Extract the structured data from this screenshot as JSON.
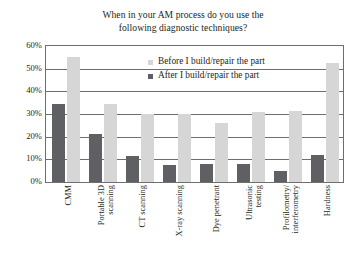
{
  "chart_data": {
    "type": "bar",
    "title": "When in your AM process do you use the following diagnostic techniques?",
    "title_lines": [
      "When in your AM process do you use the",
      "following diagnostic techniques?"
    ],
    "xlabel": "",
    "ylabel": "",
    "ylim": [
      0,
      60
    ],
    "ytick_labels": [
      "0%",
      "10%",
      "20%",
      "30%",
      "40%",
      "50%",
      "60%"
    ],
    "ytick_values": [
      0,
      10,
      20,
      30,
      40,
      50,
      60
    ],
    "grid": true,
    "legend_position": "inside-top-right",
    "categories": [
      "CMM",
      "Portable 3D scanning",
      "CT scanning",
      "X-ray scanning",
      "Dye penetrant",
      "Ultrasonic testing",
      "Profilometry/interferometry",
      "Hardness"
    ],
    "category_lines": [
      [
        "CMM"
      ],
      [
        "Portable 3D",
        "scanning"
      ],
      [
        "CT scanning"
      ],
      [
        "X-ray scanning"
      ],
      [
        "Dye penetrant"
      ],
      [
        "Ultrasonic",
        "testing"
      ],
      [
        "Profilometry/",
        "interferometry"
      ],
      [
        "Hardness"
      ]
    ],
    "series": [
      {
        "name": "Before I build/repair the part",
        "color": "#d6d6d6",
        "values": [
          55,
          34.5,
          30,
          30,
          26,
          31,
          31.5,
          52.5
        ]
      },
      {
        "name": "After I build/repair the part",
        "color": "#5e6063",
        "values": [
          34.5,
          21,
          11.5,
          7.5,
          8,
          8,
          5,
          12
        ]
      }
    ]
  },
  "legend": {
    "entries": [
      {
        "label": "Before I build/repair the part",
        "series": "before"
      },
      {
        "label": "After I build/repair the part",
        "series": "after"
      }
    ]
  }
}
